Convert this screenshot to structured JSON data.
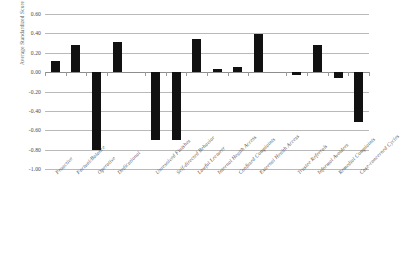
{
  "chart_data": {
    "type": "bar",
    "title": "",
    "subtitle": "",
    "xlabel": "",
    "ylabel": "Average Standardized Score",
    "ylim": [
      -1.0,
      0.6
    ],
    "grid": true,
    "legend": false,
    "legend_position": "none",
    "orientation": "vertical",
    "bar_color": "#111111",
    "gridline_color": "#b9b9b9",
    "zero_line_color": "#8d8d8d",
    "ytick_labels": [
      "0.60",
      "0.40",
      "0.20",
      "0.00",
      "-0.20",
      "-0.40",
      "-0.60",
      "-0.80",
      "-1.00"
    ],
    "ytick_values": [
      0.6,
      0.4,
      0.2,
      0.0,
      -0.2,
      -0.4,
      -0.6,
      -0.8,
      -1.0
    ],
    "categories": [
      "Proactive",
      "Factual/Balance",
      "Operative",
      "Dedicational",
      "Unresolved Finishes",
      "Self-directed Behavior",
      "Lawful Lecturer",
      "Internal Health Access",
      "Confused Complaints",
      "External Health Access",
      "Trustee Referrals",
      "Informal Avoiders",
      "Remedial Complaints",
      "Case-concerned Cycles"
    ],
    "values": [
      0.12,
      0.28,
      -0.8,
      0.31,
      -0.7,
      -0.7,
      0.34,
      0.03,
      0.05,
      0.39,
      -0.03,
      0.28,
      -0.06,
      -0.51
    ],
    "group_gaps_after": [
      3,
      9
    ]
  }
}
